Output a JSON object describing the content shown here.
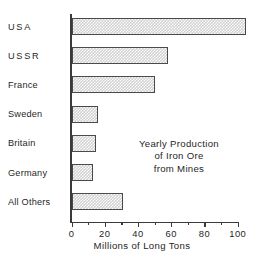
{
  "chart_data": {
    "type": "bar",
    "orientation": "horizontal",
    "title": "",
    "annotation": [
      "Yearly Production",
      "of Iron Ore",
      "from Mines"
    ],
    "categories": [
      "USA",
      "USSR",
      "France",
      "Sweden",
      "Britain",
      "Germany",
      "All Others"
    ],
    "values": [
      105,
      58,
      50,
      16,
      15,
      13,
      31
    ],
    "xlabel": "Millions of Long Tons",
    "ylabel": "",
    "xlim": [
      0,
      110
    ],
    "xticks": [
      0,
      20,
      40,
      60,
      80,
      100
    ],
    "xtick_labels": [
      "0",
      "20",
      "40",
      "60",
      "80",
      "100"
    ],
    "grid": false,
    "legend": false,
    "bar_fill": "#d2d2d2",
    "bar_border": "#4a4a4a",
    "axis_color": "#3a3a3a",
    "background": "#ffffff"
  },
  "caption": {
    "partial_text": ""
  }
}
